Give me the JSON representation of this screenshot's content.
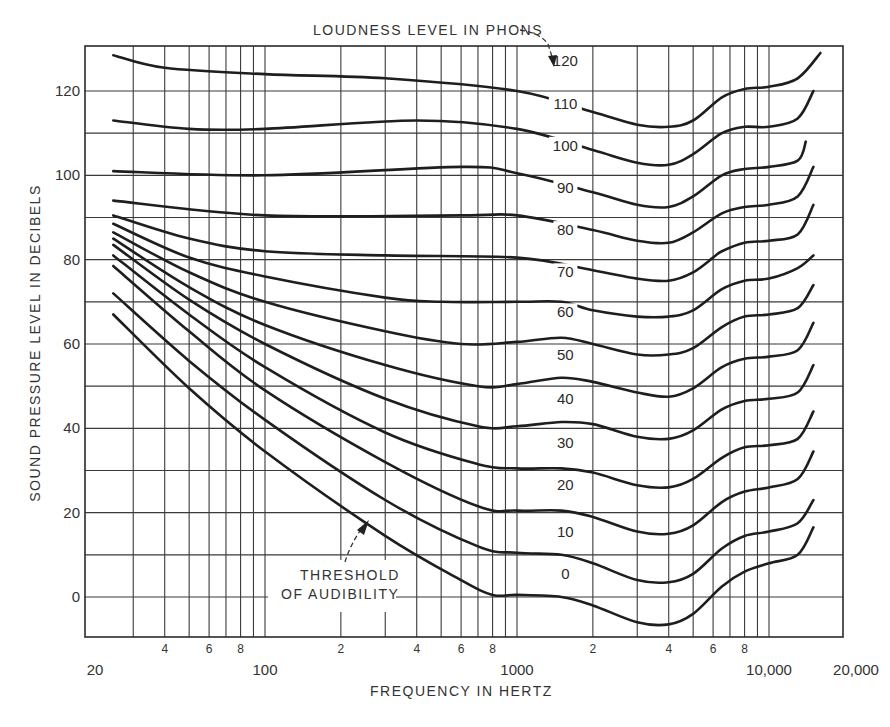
{
  "chart_data": {
    "type": "line",
    "title": "LOUDNESS LEVEL IN PHONS",
    "subtitle": "Equal-loudness contours",
    "xlabel": "FREQUENCY IN HERTZ",
    "ylabel": "SOUND PRESSURE LEVEL IN DECIBELS",
    "x_scale": "log",
    "xlim": [
      20,
      20000
    ],
    "ylim": [
      -10,
      130
    ],
    "grid": true,
    "legend_position": "inline labels near 1500 Hz",
    "x_major_tick_labels": [
      {
        "value": 20,
        "label": "20"
      },
      {
        "value": 100,
        "label": "100"
      },
      {
        "value": 1000,
        "label": "1000"
      },
      {
        "value": 10000,
        "label": "10,000"
      },
      {
        "value": 20000,
        "label": "20,000"
      }
    ],
    "x_minor_tick_labels": [
      {
        "value": 40,
        "label": "4"
      },
      {
        "value": 60,
        "label": "6"
      },
      {
        "value": 80,
        "label": "8"
      },
      {
        "value": 200,
        "label": "2"
      },
      {
        "value": 400,
        "label": "4"
      },
      {
        "value": 600,
        "label": "6"
      },
      {
        "value": 800,
        "label": "8"
      },
      {
        "value": 2000,
        "label": "2"
      },
      {
        "value": 4000,
        "label": "4"
      },
      {
        "value": 6000,
        "label": "6"
      },
      {
        "value": 8000,
        "label": "8"
      }
    ],
    "x_gridlines": [
      30,
      40,
      50,
      60,
      70,
      80,
      90,
      100,
      200,
      300,
      400,
      500,
      600,
      700,
      800,
      900,
      1000,
      2000,
      3000,
      4000,
      5000,
      6000,
      7000,
      8000,
      9000,
      10000
    ],
    "y_tick_labels": [
      {
        "value": 0,
        "label": "0"
      },
      {
        "value": 20,
        "label": "20"
      },
      {
        "value": 40,
        "label": "40"
      },
      {
        "value": 60,
        "label": "60"
      },
      {
        "value": 80,
        "label": "80"
      },
      {
        "value": 100,
        "label": "100"
      },
      {
        "value": 120,
        "label": "120"
      }
    ],
    "y_gridlines": [
      0,
      10,
      20,
      30,
      40,
      50,
      60,
      70,
      80,
      90,
      100,
      110,
      120
    ],
    "series": [
      {
        "name": "120",
        "phons": 120,
        "label_at": [
          1500,
          127
        ],
        "points": [
          [
            25,
            128.5
          ],
          [
            40,
            125.5
          ],
          [
            100,
            124
          ],
          [
            300,
            123
          ],
          [
            1000,
            120
          ],
          [
            2000,
            115
          ],
          [
            3000,
            112
          ],
          [
            4000,
            111.5
          ],
          [
            5000,
            113
          ],
          [
            6500,
            118.5
          ],
          [
            8000,
            120.5
          ],
          [
            10000,
            121
          ],
          [
            13000,
            123
          ],
          [
            16000,
            129
          ]
        ]
      },
      {
        "name": "110",
        "phons": 110,
        "label_at": [
          1500,
          117
        ],
        "points": [
          [
            25,
            113
          ],
          [
            50,
            111
          ],
          [
            100,
            111
          ],
          [
            400,
            113
          ],
          [
            1000,
            111
          ],
          [
            2000,
            106
          ],
          [
            3000,
            103
          ],
          [
            4000,
            102.5
          ],
          [
            5000,
            105
          ],
          [
            6500,
            110
          ],
          [
            8000,
            111.5
          ],
          [
            10000,
            111.5
          ],
          [
            13000,
            113.5
          ],
          [
            15000,
            120
          ]
        ]
      },
      {
        "name": "100",
        "phons": 100,
        "label_at": [
          1500,
          107
        ]
      },
      {
        "name": "90",
        "phons": 90,
        "label_at": [
          1500,
          97
        ]
      },
      {
        "name": "80",
        "phons": 80,
        "label_at": [
          1500,
          87
        ]
      },
      {
        "name": "70",
        "phons": 70,
        "label_at": [
          1500,
          77
        ]
      },
      {
        "name": "60",
        "phons": 60,
        "label_at": [
          1500,
          67.5
        ]
      },
      {
        "name": "50",
        "phons": 50,
        "label_at": [
          1500,
          57.5
        ]
      },
      {
        "name": "40",
        "phons": 40,
        "label_at": [
          1500,
          47
        ]
      },
      {
        "name": "30",
        "phons": 30,
        "label_at": [
          1500,
          36.5
        ]
      },
      {
        "name": "20",
        "phons": 20,
        "label_at": [
          1500,
          26.5
        ]
      },
      {
        "name": "10",
        "phons": 10,
        "label_at": [
          1500,
          15.5
        ]
      },
      {
        "name": "0",
        "phons": 0,
        "label_at": [
          1500,
          5.5
        ]
      }
    ],
    "annotations": [
      {
        "text_lines": [
          "THRESHOLD",
          "OF AUDIBILITY"
        ],
        "points_to_series": "0",
        "arrow_target": [
          300,
          14.5
        ]
      },
      {
        "text": "LOUDNESS LEVEL IN PHONS",
        "points_to_series": "120"
      }
    ]
  },
  "curve_points": {
    "120": [
      [
        25,
        128.5
      ],
      [
        40,
        125.5
      ],
      [
        100,
        124
      ],
      [
        300,
        123
      ],
      [
        1000,
        120
      ],
      [
        2000,
        115
      ],
      [
        3000,
        112
      ],
      [
        4000,
        111.5
      ],
      [
        5000,
        113
      ],
      [
        6500,
        118.5
      ],
      [
        8000,
        120.5
      ],
      [
        10000,
        121
      ],
      [
        13000,
        123
      ],
      [
        16000,
        129
      ]
    ],
    "110": [
      [
        25,
        113
      ],
      [
        50,
        111
      ],
      [
        100,
        111
      ],
      [
        400,
        113
      ],
      [
        1000,
        111
      ],
      [
        2000,
        106
      ],
      [
        3000,
        103
      ],
      [
        4000,
        102.5
      ],
      [
        5000,
        105
      ],
      [
        6500,
        110
      ],
      [
        8000,
        111.5
      ],
      [
        10000,
        111.5
      ],
      [
        13000,
        113.5
      ],
      [
        15000,
        120
      ]
    ],
    "100": [
      [
        25,
        101
      ],
      [
        100,
        100
      ],
      [
        600,
        102
      ],
      [
        1000,
        100.5
      ],
      [
        2000,
        96
      ],
      [
        3000,
        93
      ],
      [
        4000,
        92.5
      ],
      [
        5000,
        95
      ],
      [
        6500,
        100
      ],
      [
        8000,
        101.5
      ],
      [
        10000,
        102
      ],
      [
        13000,
        103.5
      ],
      [
        14000,
        108
      ]
    ],
    "90": [
      [
        25,
        94
      ],
      [
        100,
        90.5
      ],
      [
        600,
        90.5
      ],
      [
        1000,
        90.5
      ],
      [
        2000,
        87
      ],
      [
        3000,
        84.5
      ],
      [
        4000,
        84
      ],
      [
        5000,
        86.5
      ],
      [
        6500,
        91
      ],
      [
        8000,
        92.5
      ],
      [
        10000,
        93
      ],
      [
        13000,
        95
      ],
      [
        15000,
        102
      ]
    ],
    "80": [
      [
        25,
        90.5
      ],
      [
        50,
        85
      ],
      [
        100,
        82
      ],
      [
        300,
        81
      ],
      [
        1000,
        80.5
      ],
      [
        2000,
        77.5
      ],
      [
        3000,
        75.5
      ],
      [
        4000,
        75
      ],
      [
        5000,
        77
      ],
      [
        6000,
        80.5
      ],
      [
        6500,
        82
      ],
      [
        8000,
        84
      ],
      [
        10000,
        84.5
      ],
      [
        13000,
        86
      ],
      [
        15000,
        93
      ]
    ],
    "70": [
      [
        25,
        88.5
      ],
      [
        50,
        80.5
      ],
      [
        100,
        76
      ],
      [
        300,
        71
      ],
      [
        500,
        70
      ],
      [
        1000,
        70
      ],
      [
        1500,
        70
      ],
      [
        2000,
        68
      ],
      [
        3000,
        66.5
      ],
      [
        4000,
        66.5
      ],
      [
        5000,
        68
      ],
      [
        6500,
        73
      ],
      [
        8000,
        75
      ],
      [
        10000,
        75.5
      ],
      [
        13000,
        78
      ],
      [
        15000,
        81
      ]
    ],
    "60": [
      [
        25,
        86.5
      ],
      [
        50,
        77
      ],
      [
        100,
        70
      ],
      [
        300,
        63
      ],
      [
        600,
        60
      ],
      [
        1000,
        60.5
      ],
      [
        1500,
        61.5
      ],
      [
        2000,
        60
      ],
      [
        3000,
        57.5
      ],
      [
        4000,
        57.5
      ],
      [
        5000,
        59
      ],
      [
        6500,
        64
      ],
      [
        8000,
        66.5
      ],
      [
        10000,
        67
      ],
      [
        13000,
        68.5
      ],
      [
        15000,
        74
      ]
    ],
    "50": [
      [
        25,
        85
      ],
      [
        50,
        73.5
      ],
      [
        100,
        64.5
      ],
      [
        300,
        55
      ],
      [
        700,
        50
      ],
      [
        1000,
        50.5
      ],
      [
        1500,
        52
      ],
      [
        2000,
        51
      ],
      [
        3000,
        48.5
      ],
      [
        4000,
        47.5
      ],
      [
        5000,
        49.5
      ],
      [
        6500,
        54.5
      ],
      [
        8000,
        56.5
      ],
      [
        10000,
        57
      ],
      [
        13000,
        58.5
      ],
      [
        15000,
        65
      ]
    ],
    "40": [
      [
        25,
        83.5
      ],
      [
        50,
        70.5
      ],
      [
        100,
        60
      ],
      [
        300,
        47
      ],
      [
        700,
        40.5
      ],
      [
        1000,
        40.5
      ],
      [
        1500,
        41.5
      ],
      [
        2000,
        41
      ],
      [
        3000,
        38
      ],
      [
        4000,
        37.5
      ],
      [
        5000,
        39.5
      ],
      [
        6500,
        44.5
      ],
      [
        8000,
        46.5
      ],
      [
        10000,
        47
      ],
      [
        13000,
        48.5
      ],
      [
        15000,
        55
      ]
    ],
    "30": [
      [
        25,
        81
      ],
      [
        50,
        67
      ],
      [
        100,
        54.5
      ],
      [
        300,
        39
      ],
      [
        700,
        31.5
      ],
      [
        1000,
        30.5
      ],
      [
        1500,
        30.5
      ],
      [
        2000,
        29.5
      ],
      [
        3000,
        26.5
      ],
      [
        4000,
        26
      ],
      [
        5000,
        28
      ],
      [
        6500,
        33
      ],
      [
        8000,
        35.5
      ],
      [
        10000,
        36
      ],
      [
        13000,
        37.5
      ],
      [
        15000,
        44
      ]
    ],
    "20": [
      [
        25,
        78.5
      ],
      [
        50,
        63
      ],
      [
        100,
        49
      ],
      [
        300,
        32
      ],
      [
        700,
        21.5
      ],
      [
        1000,
        20.5
      ],
      [
        1500,
        20.5
      ],
      [
        2000,
        19
      ],
      [
        3000,
        15.5
      ],
      [
        4000,
        15
      ],
      [
        5000,
        17
      ],
      [
        6500,
        22.5
      ],
      [
        8000,
        25
      ],
      [
        10000,
        26
      ],
      [
        13000,
        28
      ],
      [
        15000,
        34.5
      ]
    ],
    "10": [
      [
        25,
        72
      ],
      [
        50,
        56
      ],
      [
        100,
        42
      ],
      [
        300,
        23
      ],
      [
        700,
        12
      ],
      [
        1000,
        10.5
      ],
      [
        1500,
        10
      ],
      [
        2000,
        8
      ],
      [
        3000,
        4
      ],
      [
        4000,
        3.5
      ],
      [
        5000,
        5.5
      ],
      [
        6500,
        11.5
      ],
      [
        8000,
        14.5
      ],
      [
        10000,
        15.5
      ],
      [
        13000,
        17.5
      ],
      [
        15000,
        23
      ]
    ],
    "0": [
      [
        25,
        67
      ],
      [
        50,
        49.5
      ],
      [
        100,
        34.5
      ],
      [
        300,
        14.5
      ],
      [
        600,
        4
      ],
      [
        800,
        0.5
      ],
      [
        1000,
        0.5
      ],
      [
        1500,
        0
      ],
      [
        2000,
        -2
      ],
      [
        3000,
        -6
      ],
      [
        4000,
        -6.5
      ],
      [
        5000,
        -4
      ],
      [
        6500,
        2.5
      ],
      [
        8000,
        6
      ],
      [
        10000,
        8
      ],
      [
        13000,
        10
      ],
      [
        15000,
        16.5
      ]
    ]
  },
  "colors": {
    "background": "#ffffff",
    "grid": "#3a3a3a",
    "curve": "#1e1e1e",
    "text": "#333333"
  }
}
